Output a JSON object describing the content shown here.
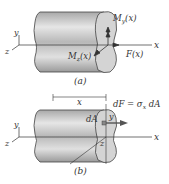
{
  "figure_a": {
    "caption": "(a)",
    "labels": {
      "my": "M",
      "my_sub": "y",
      "my_arg": "(x)",
      "mz": "M",
      "mz_sub": "z",
      "mz_arg": "(x)",
      "f": "F(x)",
      "x_axis": "x",
      "y_axis": "y",
      "z_axis": "z"
    }
  },
  "figure_b": {
    "caption": "(b)",
    "labels": {
      "dim_x": "x",
      "dF_eq": "dF = σ",
      "dF_sub": "x",
      "dF_tail": " dA",
      "dA": "dA",
      "y_local": "y",
      "z_local": "z",
      "x_axis": "x",
      "y_axis": "y",
      "z_axis": "z"
    }
  },
  "colors": {
    "body_light": "#e2e2e2",
    "body_dark": "#9a9a9a",
    "face": "#d4d4d4",
    "line": "#333333"
  }
}
